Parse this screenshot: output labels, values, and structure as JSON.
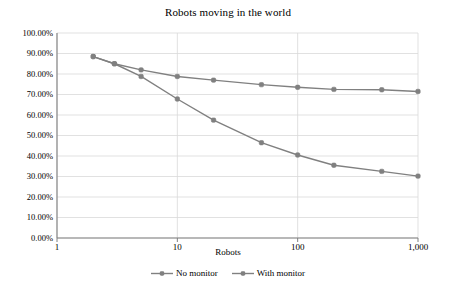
{
  "chart_data": {
    "type": "line",
    "title": "Robots moving in the world",
    "xlabel": "Robots",
    "ylabel": "",
    "xscale": "log",
    "xlim": [
      1,
      1000
    ],
    "ylim": [
      0,
      1
    ],
    "grid": true,
    "legend_position": "bottom",
    "x": [
      2,
      3,
      5,
      10,
      20,
      50,
      100,
      200,
      500,
      1000
    ],
    "xticks": [
      1,
      10,
      100,
      1000
    ],
    "xticklabels": [
      "1",
      "10",
      "100",
      "1,000"
    ],
    "yticks": [
      0,
      0.1,
      0.2,
      0.3,
      0.4,
      0.5,
      0.6,
      0.7,
      0.8,
      0.9,
      1.0
    ],
    "yticklabels": [
      "0.00%",
      "10.00%",
      "20.00%",
      "30.00%",
      "40.00%",
      "50.00%",
      "60.00%",
      "70.00%",
      "80.00%",
      "90.00%",
      "100.00%"
    ],
    "series": [
      {
        "name": "No monitor",
        "color": "#808080",
        "values": [
          0.885,
          0.85,
          0.82,
          0.788,
          0.77,
          0.748,
          0.735,
          0.725,
          0.723,
          0.715
        ]
      },
      {
        "name": "With monitor",
        "color": "#808080",
        "values": [
          0.885,
          0.85,
          0.788,
          0.678,
          0.575,
          0.465,
          0.405,
          0.355,
          0.325,
          0.302
        ]
      }
    ]
  },
  "colors": {
    "line": "#808080",
    "marker": "#808080",
    "grid": "#d9d9d9",
    "axis": "#808080",
    "text": "#000000",
    "background": "#ffffff"
  }
}
